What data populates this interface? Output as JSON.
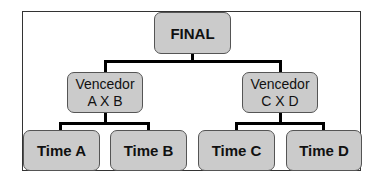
{
  "diagram": {
    "type": "tournament-bracket",
    "root": {
      "label": "FINAL"
    },
    "semifinals": [
      {
        "line1": "Vencedor",
        "line2": "A X B"
      },
      {
        "line1": "Vencedor",
        "line2": "C X D"
      }
    ],
    "teams": [
      {
        "label": "Time A"
      },
      {
        "label": "Time B"
      },
      {
        "label": "Time C"
      },
      {
        "label": "Time D"
      }
    ],
    "edges": [
      [
        "FINAL",
        "Vencedor A X B"
      ],
      [
        "FINAL",
        "Vencedor C X D"
      ],
      [
        "Vencedor A X B",
        "Time A"
      ],
      [
        "Vencedor A X B",
        "Time B"
      ],
      [
        "Vencedor C X D",
        "Time C"
      ],
      [
        "Vencedor C X D",
        "Time D"
      ]
    ],
    "colors": {
      "node_fill": "#cbcbcb",
      "node_border": "#555555",
      "connector": "#000000",
      "frame": "#333333"
    }
  }
}
